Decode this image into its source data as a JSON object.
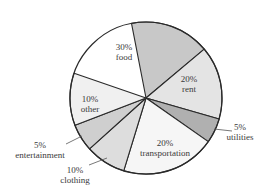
{
  "chart_data": {
    "type": "pie",
    "title": "",
    "slices": [
      {
        "label": "food",
        "percent_label": "30%",
        "value": 30,
        "color": "#c8c8c8",
        "start_deg": -101,
        "end_deg": -40,
        "label_pos": [
          124,
          50
        ],
        "label_inside": true
      },
      {
        "label": "rent",
        "percent_label": "20%",
        "value": 20,
        "color": "#e4e4e4",
        "start_deg": -40,
        "end_deg": 16,
        "label_pos": [
          189,
          82
        ],
        "label_inside": true
      },
      {
        "label": "utilities",
        "percent_label": "5%",
        "value": 5,
        "color": "#b0b0b0",
        "start_deg": 16,
        "end_deg": 35,
        "label_pos": [
          240,
          130
        ],
        "label_inside": false,
        "leader": [
          [
            214,
            129
          ],
          [
            232,
            131
          ]
        ]
      },
      {
        "label": "transportation",
        "percent_label": "20%",
        "value": 20,
        "color": "#f6f6f6",
        "start_deg": 35,
        "end_deg": 107,
        "label_pos": [
          165,
          146
        ],
        "label_inside": true
      },
      {
        "label": "clothing",
        "percent_label": "10%",
        "value": 10,
        "color": "#dddddd",
        "start_deg": 107,
        "end_deg": 138,
        "label_pos": [
          75,
          173
        ],
        "label_inside": false,
        "leader": [
          [
            107,
            158
          ],
          [
            89,
            165
          ]
        ]
      },
      {
        "label": "entertainment",
        "percent_label": "5%",
        "value": 5,
        "color": "#cfcfcf",
        "start_deg": 138,
        "end_deg": 159,
        "label_pos": [
          40,
          148
        ],
        "label_inside": false,
        "leader": [
          [
            82,
            136
          ],
          [
            66,
            144
          ]
        ]
      },
      {
        "label": "other",
        "percent_label": "10%",
        "value": 10,
        "color": "#f0f0f0",
        "start_deg": 159,
        "end_deg": 199,
        "label_pos": [
          90,
          102
        ],
        "label_inside": true
      }
    ],
    "center": [
      146,
      98
    ],
    "radius": 76,
    "legend": "none",
    "stroke_color": "#2a2a2a"
  }
}
